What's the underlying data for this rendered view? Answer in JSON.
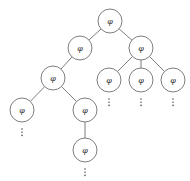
{
  "diagram": {
    "type": "tree",
    "node_radius": 12,
    "node_label": "φ",
    "colors": {
      "stroke": "#6e6e6e",
      "label": "#333333",
      "background": "#ffffff"
    },
    "nodes": [
      {
        "id": "root",
        "x": 110,
        "y": 21,
        "label": "φ"
      },
      {
        "id": "l1-left",
        "x": 80,
        "y": 48,
        "label": "φ"
      },
      {
        "id": "l1-right",
        "x": 141,
        "y": 48,
        "label": "φ"
      },
      {
        "id": "l2-left",
        "x": 53,
        "y": 78,
        "label": "φ"
      },
      {
        "id": "l2-right-a",
        "x": 109,
        "y": 80,
        "label": "φ"
      },
      {
        "id": "l2-right-b",
        "x": 141,
        "y": 80,
        "label": "φ"
      },
      {
        "id": "l2-right-c",
        "x": 173,
        "y": 80,
        "label": "φ"
      },
      {
        "id": "l3-left",
        "x": 22,
        "y": 110,
        "label": "φ"
      },
      {
        "id": "l3-right",
        "x": 85,
        "y": 110,
        "label": "φ"
      },
      {
        "id": "l4",
        "x": 85,
        "y": 150,
        "label": "φ"
      }
    ],
    "edges": [
      [
        "root",
        "l1-left"
      ],
      [
        "root",
        "l1-right"
      ],
      [
        "l1-left",
        "l2-left"
      ],
      [
        "l1-right",
        "l2-right-a"
      ],
      [
        "l1-right",
        "l2-right-b"
      ],
      [
        "l1-right",
        "l2-right-c"
      ],
      [
        "l2-left",
        "l3-left"
      ],
      [
        "l2-left",
        "l3-right"
      ],
      [
        "l3-right",
        "l4"
      ]
    ],
    "continuations": [
      {
        "below": "l3-left",
        "symbol": "⋮"
      },
      {
        "below": "l2-right-a",
        "symbol": "⋮"
      },
      {
        "below": "l2-right-b",
        "symbol": "⋮"
      },
      {
        "below": "l2-right-c",
        "symbol": "⋮"
      },
      {
        "below": "l4",
        "symbol": "⋮"
      }
    ]
  }
}
